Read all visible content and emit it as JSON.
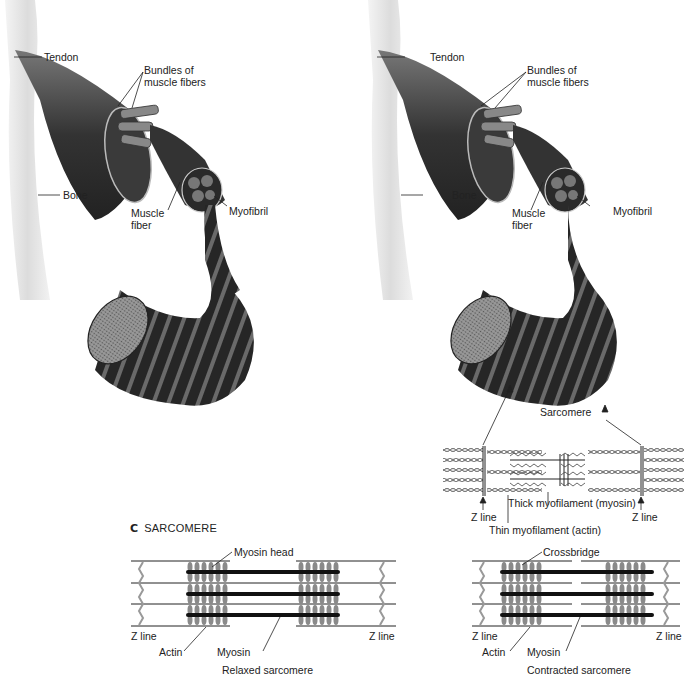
{
  "panel_a": {
    "labels": {
      "tendon": "Tendon",
      "bundles": "Bundles of\nmuscle fibers",
      "bundles_line1": "Bundles of",
      "bundles_line2": "muscle fibers",
      "bone": "Bone",
      "muscle_fiber_line1": "Muscle",
      "muscle_fiber_line2": "fiber",
      "myofibril": "Myofibril"
    }
  },
  "panel_b": {
    "labels": {
      "tendon": "Tendon",
      "bundles_line1": "Bundles of",
      "bundles_line2": "muscle fibers",
      "bone": "Bone",
      "muscle_fiber_line1": "Muscle",
      "muscle_fiber_line2": "fiber",
      "myofibril": "Myofibril",
      "sarcomere": "Sarcomere",
      "z_line_left": "Z line",
      "z_line_right": "Z line",
      "thick": "Thick myofilament (myosin)",
      "thin": "Thin myofilament (actin)"
    }
  },
  "panel_c": {
    "letter": "C",
    "title": "SARCOMERE",
    "relaxed": {
      "myosin_head": "Myosin head",
      "z_line_left": "Z line",
      "z_line_right": "Z line",
      "actin": "Actin",
      "myosin": "Myosin",
      "caption": "Relaxed sarcomere"
    },
    "contracted": {
      "crossbridge": "Crossbridge",
      "z_line_left": "Z line",
      "z_line_right": "Z line",
      "actin": "Actin",
      "myosin": "Myosin",
      "caption": "Contracted sarcomere"
    }
  },
  "colors": {
    "ink": "#222222",
    "muscle_dark": "#2a2a2a",
    "muscle_mid": "#555555",
    "bone": "#e6e6e6",
    "head_gray": "#8a8a8a"
  }
}
